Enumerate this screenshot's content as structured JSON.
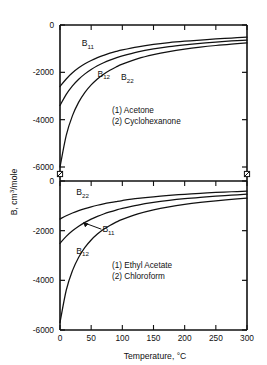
{
  "figure": {
    "title": "",
    "background_color": "#ffffff",
    "ink_color": "#111111",
    "axis_label_y": "B, cm3/mole",
    "axis_label_y_parts": {
      "prefix": "B, cm",
      "superscript": "3",
      "suffix": "/mole"
    },
    "axis_label_x": "Temperature, °C",
    "axis_break_note": "broken y-axis between the two stacked panels"
  },
  "chart_data": [
    {
      "type": "line",
      "panel": "top",
      "title": "",
      "xlabel": "",
      "ylabel": "B, cm3/mole",
      "xlim": [
        0,
        300
      ],
      "ylim": [
        -6000,
        0
      ],
      "xticks": [
        0,
        50,
        100,
        150,
        200,
        250,
        300
      ],
      "xticklabels": [
        "0",
        "50",
        "100",
        "150",
        "200",
        "250",
        "300"
      ],
      "yticks": [
        0,
        -2000,
        -4000,
        -6000
      ],
      "yticklabels": [
        "0",
        "-2000",
        "-4000",
        "-6000"
      ],
      "grid": false,
      "legend_position": "center-right-inside",
      "legend": [
        "(1) Acetone",
        "(2) Cyclohexanone"
      ],
      "annotations": [
        "B11",
        "B12",
        "B22"
      ],
      "x": [
        0,
        10,
        20,
        30,
        40,
        50,
        60,
        70,
        80,
        90,
        100,
        125,
        150,
        175,
        200,
        225,
        250,
        275,
        300
      ],
      "series": [
        {
          "name": "B11",
          "label": "B11",
          "label_sub": "11",
          "label_x": 35,
          "label_y": -900,
          "values": [
            -2600,
            -2280,
            -2020,
            -1810,
            -1640,
            -1500,
            -1380,
            -1280,
            -1190,
            -1115,
            -1050,
            -920,
            -820,
            -745,
            -685,
            -635,
            -590,
            -550,
            -515
          ]
        },
        {
          "name": "B12",
          "label": "B12",
          "label_sub": "12",
          "label_x": 60,
          "label_y": -2180,
          "values": [
            -3400,
            -2930,
            -2570,
            -2290,
            -2065,
            -1880,
            -1725,
            -1595,
            -1485,
            -1390,
            -1305,
            -1135,
            -1010,
            -915,
            -840,
            -775,
            -720,
            -675,
            -635
          ]
        },
        {
          "name": "B22",
          "label": "B22",
          "label_sub": "22",
          "label_x": 98,
          "label_y": -2320,
          "values": [
            -6000,
            -4660,
            -3830,
            -3260,
            -2845,
            -2530,
            -2280,
            -2080,
            -1915,
            -1775,
            -1655,
            -1420,
            -1250,
            -1120,
            -1018,
            -935,
            -866,
            -808,
            -758
          ]
        }
      ]
    },
    {
      "type": "line",
      "panel": "bottom",
      "title": "",
      "xlabel": "Temperature, °C",
      "ylabel": "B, cm3/mole",
      "xlim": [
        0,
        300
      ],
      "ylim": [
        -6000,
        0
      ],
      "xticks": [
        0,
        50,
        100,
        150,
        200,
        250,
        300
      ],
      "xticklabels": [
        "0",
        "50",
        "100",
        "150",
        "200",
        "250",
        "300"
      ],
      "yticks": [
        0,
        -2000,
        -4000,
        -6000
      ],
      "yticklabels": [
        "0",
        "-2000",
        "-4000",
        "-6000"
      ],
      "grid": false,
      "legend_position": "center-right-inside",
      "legend": [
        "(1) Ethyl Acetate",
        "(2) Chloroform"
      ],
      "annotations": [
        "B22",
        "B11",
        "B12"
      ],
      "x": [
        0,
        10,
        20,
        30,
        40,
        50,
        60,
        70,
        80,
        90,
        100,
        125,
        150,
        175,
        200,
        225,
        250,
        275,
        300
      ],
      "series": [
        {
          "name": "B22",
          "label": "B22",
          "label_sub": "22",
          "label_x": 26,
          "label_y": -560,
          "values": [
            -1530,
            -1400,
            -1290,
            -1195,
            -1112,
            -1040,
            -977,
            -921,
            -871,
            -826,
            -786,
            -702,
            -635,
            -580,
            -534,
            -495,
            -462,
            -433,
            -408
          ]
        },
        {
          "name": "B11",
          "label": "B11",
          "label_sub": "11",
          "label_x": 68,
          "label_y": -2060,
          "values": [
            -2510,
            -2230,
            -2005,
            -1820,
            -1665,
            -1535,
            -1424,
            -1328,
            -1244,
            -1170,
            -1104,
            -968,
            -864,
            -781,
            -713,
            -657,
            -609,
            -568,
            -532
          ]
        },
        {
          "name": "B12",
          "label": "B12",
          "label_sub": "12",
          "label_x": 26,
          "label_y": -2930,
          "values": [
            -5700,
            -4400,
            -3610,
            -3070,
            -2675,
            -2375,
            -2138,
            -1947,
            -1790,
            -1658,
            -1546,
            -1325,
            -1163,
            -1040,
            -942,
            -863,
            -797,
            -742,
            -694
          ]
        }
      ]
    }
  ]
}
